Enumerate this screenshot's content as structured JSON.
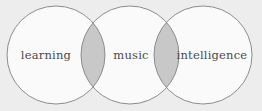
{
  "figure": {
    "name": "three-circle-venn-diagram",
    "type": "venn",
    "background_color": "#ededed",
    "circle_fill": "#fafafa",
    "overlap_fill": "#c8c8c8",
    "stroke_color": "#8c8c8c",
    "label_color": "#4a4a4a"
  },
  "circles": [
    {
      "label": "learning",
      "cx": 56,
      "cy": 55,
      "r": 49
    },
    {
      "label": "music",
      "cx": 130,
      "cy": 55,
      "r": 49
    },
    {
      "label": "intelligence",
      "cx": 203,
      "cy": 55,
      "r": 49
    }
  ],
  "labels": {
    "left": "learning",
    "middle": "music",
    "right": "intelligence"
  },
  "overlaps": [
    {
      "name": "learning-music-overlap",
      "between": [
        "learning",
        "music"
      ]
    },
    {
      "name": "music-intelligence-overlap",
      "between": [
        "music",
        "intelligence"
      ]
    }
  ]
}
